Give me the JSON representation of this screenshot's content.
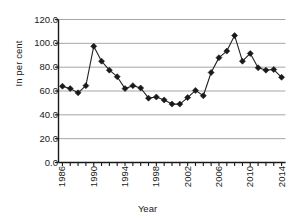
{
  "chart_data": {
    "type": "line",
    "title": "",
    "xlabel": "Year",
    "ylabel": "In per cent",
    "grid": true,
    "legend": false,
    "marker": "diamond",
    "line_color": "#222222",
    "marker_color": "#1a1a1a",
    "grid_color": "#a6a6a6",
    "axis_color": "#1a1a1a",
    "xlim": [
      1985.5,
      2014.5
    ],
    "ylim": [
      0.0,
      120.0
    ],
    "ytick_labels": [
      "0.0",
      "20.0",
      "40.0",
      "60.0",
      "80.0",
      "100.0",
      "120.0"
    ],
    "ytick_values": [
      0,
      20,
      40,
      60,
      80,
      100,
      120
    ],
    "xtick_labels": [
      "1986",
      "1990",
      "1994",
      "1998",
      "2002",
      "2006",
      "2010",
      "2014"
    ],
    "xtick_values": [
      1986,
      1990,
      1994,
      1998,
      2002,
      2006,
      2010,
      2014
    ],
    "x_minor_every": 1,
    "x": [
      1986,
      1987,
      1988,
      1989,
      1990,
      1991,
      1992,
      1993,
      1994,
      1995,
      1996,
      1997,
      1998,
      1999,
      2000,
      2001,
      2002,
      2003,
      2004,
      2005,
      2006,
      2007,
      2008,
      2009,
      2010,
      2011,
      2012,
      2013,
      2014
    ],
    "categories": [
      "1986",
      "1987",
      "1988",
      "1989",
      "1990",
      "1991",
      "1992",
      "1993",
      "1994",
      "1995",
      "1996",
      "1997",
      "1998",
      "1999",
      "2000",
      "2001",
      "2002",
      "2003",
      "2004",
      "2005",
      "2006",
      "2007",
      "2008",
      "2009",
      "2010",
      "2011",
      "2012",
      "2013",
      "2014"
    ],
    "values": [
      64.0,
      62.0,
      58.5,
      64.5,
      97.5,
      85.0,
      77.5,
      72.0,
      62.0,
      64.5,
      62.5,
      54.0,
      55.0,
      52.5,
      49.0,
      49.0,
      54.5,
      60.5,
      56.0,
      75.5,
      88.0,
      93.5,
      106.5,
      85.0,
      91.5,
      79.5,
      77.5,
      78.0,
      71.5
    ],
    "series": [
      {
        "name": "In per cent",
        "values": [
          64.0,
          62.0,
          58.5,
          64.5,
          97.5,
          85.0,
          77.5,
          72.0,
          62.0,
          64.5,
          62.5,
          54.0,
          55.0,
          52.5,
          49.0,
          49.0,
          54.5,
          60.5,
          56.0,
          75.5,
          88.0,
          93.5,
          106.5,
          85.0,
          91.5,
          79.5,
          77.5,
          78.0,
          71.5
        ]
      }
    ]
  }
}
